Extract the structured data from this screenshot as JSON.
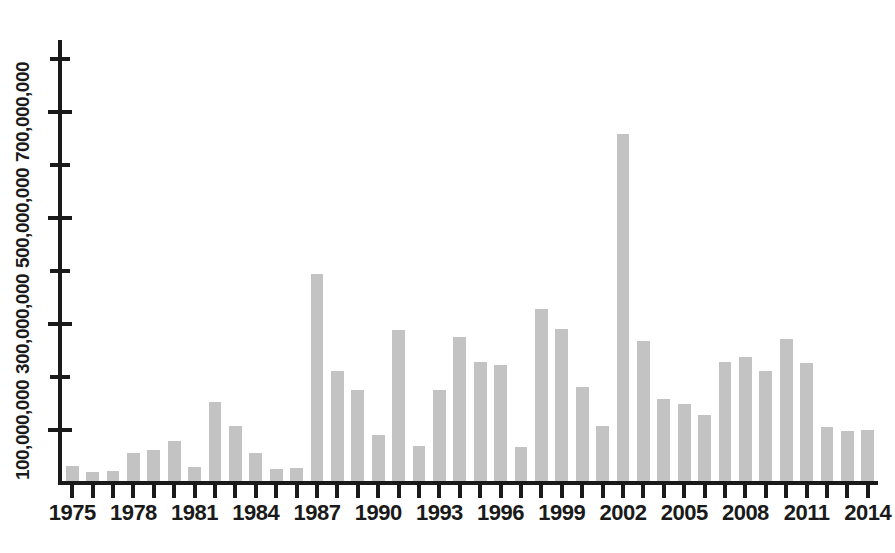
{
  "chart_data": {
    "type": "bar",
    "title": "",
    "subtitle": "",
    "xlabel": "",
    "ylabel": "",
    "grid": false,
    "legend": null,
    "bar_color": "#c3c3c3",
    "axis_color": "#1a1a1a",
    "xlim": [
      1974.5,
      2014.5
    ],
    "ylim": [
      0,
      800000000
    ],
    "y_major_ticks": [
      100000000,
      300000000,
      500000000,
      700000000
    ],
    "y_major_tick_labels": [
      "100,000,000",
      "300,000,000",
      "500,000,000",
      "700,000,000"
    ],
    "y_minor_ticks": [
      200000000,
      400000000,
      600000000,
      800000000
    ],
    "x_tick_labels": [
      "1975",
      "1978",
      "1981",
      "1984",
      "1987",
      "1990",
      "1993",
      "1996",
      "1999",
      "2002",
      "2005",
      "2008",
      "2011",
      "2014"
    ],
    "categories": [
      "1975",
      "1976",
      "1977",
      "1978",
      "1979",
      "1980",
      "1981",
      "1982",
      "1983",
      "1984",
      "1985",
      "1986",
      "1987",
      "1988",
      "1989",
      "1990",
      "1991",
      "1992",
      "1993",
      "1994",
      "1995",
      "1996",
      "1997",
      "1998",
      "1999",
      "2000",
      "2001",
      "2002",
      "2003",
      "2004",
      "2005",
      "2006",
      "2007",
      "2008",
      "2009",
      "2010",
      "2011",
      "2012",
      "2013",
      "2014"
    ],
    "values": [
      32000000,
      20000000,
      22000000,
      56000000,
      62000000,
      80000000,
      30000000,
      152000000,
      108000000,
      56000000,
      26000000,
      28000000,
      395000000,
      212000000,
      176000000,
      90000000,
      288000000,
      70000000,
      176000000,
      276000000,
      228000000,
      222000000,
      68000000,
      328000000,
      290000000,
      182000000,
      108000000,
      658000000,
      268000000,
      158000000,
      150000000,
      128000000,
      228000000,
      238000000,
      212000000,
      272000000,
      226000000,
      106000000,
      98000000,
      100000000
    ]
  }
}
